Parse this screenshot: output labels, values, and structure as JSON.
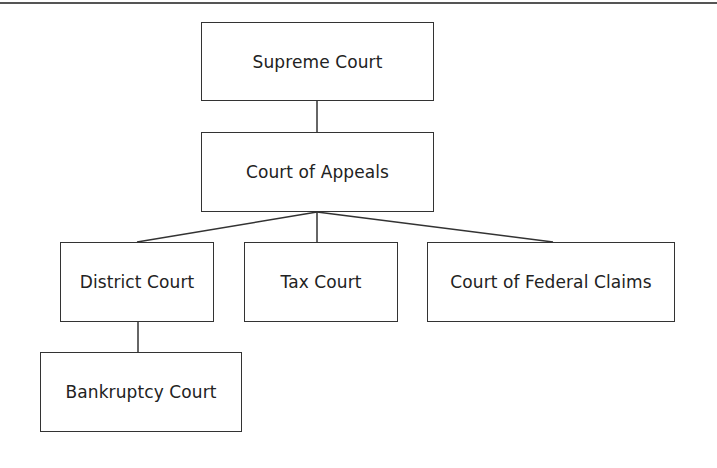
{
  "diagram": {
    "type": "org-chart",
    "nodes": [
      {
        "id": "supreme",
        "label": "Supreme Court",
        "x": 201,
        "y": 22,
        "w": 233,
        "h": 79
      },
      {
        "id": "appeals",
        "label": "Court of Appeals",
        "x": 201,
        "y": 132,
        "w": 233,
        "h": 80
      },
      {
        "id": "district",
        "label": "District Court",
        "x": 60,
        "y": 242,
        "w": 154,
        "h": 80
      },
      {
        "id": "tax",
        "label": "Tax Court",
        "x": 244,
        "y": 242,
        "w": 154,
        "h": 80
      },
      {
        "id": "federal",
        "label": "Court of Federal Claims",
        "x": 427,
        "y": 242,
        "w": 248,
        "h": 80
      },
      {
        "id": "bankruptcy",
        "label": "Bankruptcy Court",
        "x": 40,
        "y": 352,
        "w": 202,
        "h": 80
      }
    ],
    "edges": [
      {
        "from": "supreme",
        "to": "appeals"
      },
      {
        "from": "appeals",
        "to": "district"
      },
      {
        "from": "appeals",
        "to": "tax"
      },
      {
        "from": "appeals",
        "to": "federal"
      },
      {
        "from": "district",
        "to": "bankruptcy"
      }
    ]
  }
}
